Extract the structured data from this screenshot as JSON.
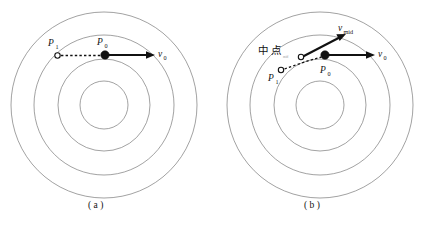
{
  "figure": {
    "title": "",
    "background_color": "#ffffff",
    "ring_color": "#7a7a7a",
    "vector_color": "#111111",
    "panels": [
      {
        "id": "a",
        "caption": "( a )",
        "center": {
          "x": 104,
          "y": 105
        },
        "ring_radii": [
          24,
          46,
          70,
          93
        ],
        "points": [
          {
            "name": "P1",
            "label": "P",
            "subscript": "1",
            "style": "hollow",
            "x": 57,
            "y": 55
          },
          {
            "name": "P0",
            "label": "P",
            "subscript": "0",
            "style": "filled",
            "x": 105,
            "y": 55
          }
        ],
        "vectors": [
          {
            "name": "v0",
            "label": "v",
            "subscript": "0",
            "from": {
              "x": 105,
              "y": 55
            },
            "to": {
              "x": 152,
              "y": 55
            },
            "label_x": 158,
            "label_y": 57
          }
        ],
        "dashed_segments": [
          {
            "from": {
              "x": 60,
              "y": 55
            },
            "to": {
              "x": 101,
              "y": 55
            }
          }
        ],
        "annotations": []
      },
      {
        "id": "b",
        "caption": "( b )",
        "center": {
          "x": 320,
          "y": 105
        },
        "ring_radii": [
          24,
          46,
          70,
          93
        ],
        "points": [
          {
            "name": "P1",
            "label": "P",
            "subscript": "1",
            "style": "hollow",
            "x": 281,
            "y": 70
          },
          {
            "name": "Pmid",
            "label": "",
            "subscript": "",
            "style": "hollow",
            "x": 301,
            "y": 57
          },
          {
            "name": "P0",
            "label": "P",
            "subscript": "0",
            "style": "filled",
            "x": 325,
            "y": 55
          }
        ],
        "vectors": [
          {
            "name": "v0",
            "label": "v",
            "subscript": "0",
            "from": {
              "x": 325,
              "y": 55
            },
            "to": {
              "x": 372,
              "y": 55
            },
            "label_x": 378,
            "label_y": 57
          },
          {
            "name": "vmid",
            "label": "v",
            "subscript": "mid",
            "from": {
              "x": 301,
              "y": 57
            },
            "to": {
              "x": 345,
              "y": 35
            },
            "label_x": 340,
            "label_y": 30
          }
        ],
        "dashed_segments": [
          {
            "from": {
              "x": 284,
              "y": 69
            },
            "to": {
              "x": 322,
              "y": 57
            }
          }
        ],
        "annotations": [
          {
            "name": "midpoint-label",
            "text": "中 点",
            "x": 259,
            "y": 52
          },
          {
            "name": "midpoint-sublabel",
            "text": "mid",
            "x": 285,
            "y": 56
          }
        ]
      }
    ]
  }
}
